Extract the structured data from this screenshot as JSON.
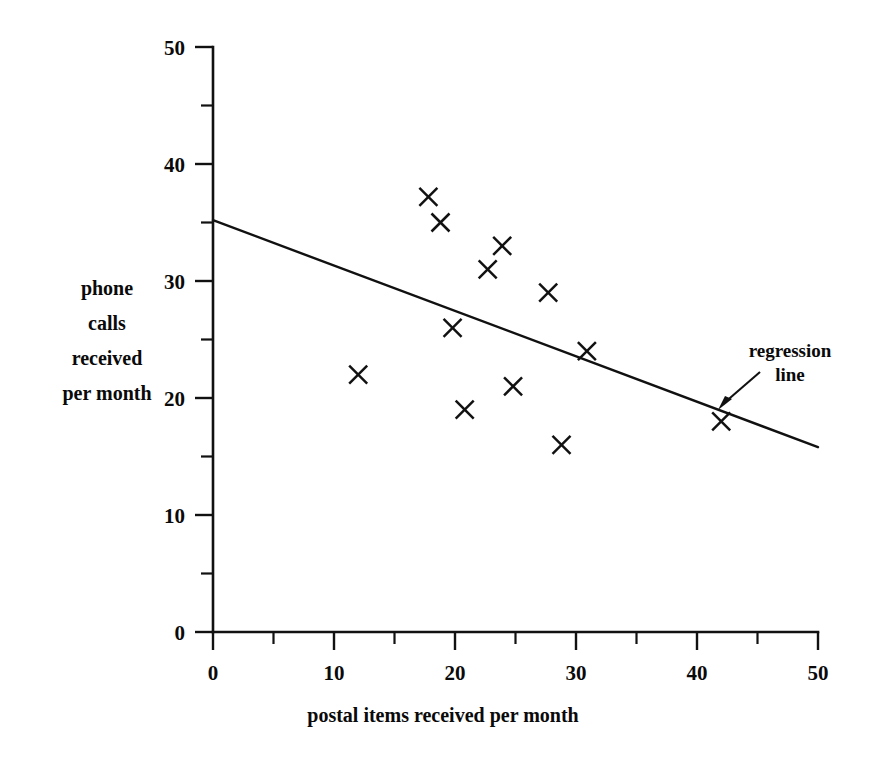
{
  "chart_data": {
    "type": "scatter",
    "title": "",
    "xlabel": "postal items received per month",
    "ylabel": "phone calls received per month",
    "ylabel_lines": [
      "phone",
      "calls",
      "received",
      "per month"
    ],
    "xlim": [
      0,
      50
    ],
    "ylim": [
      0,
      50
    ],
    "grid": false,
    "legend": "none",
    "x_major_ticks": [
      0,
      10,
      20,
      30,
      40,
      50
    ],
    "x_minor_ticks": [
      5,
      15,
      25,
      35,
      45
    ],
    "x_tick_labels": [
      "0",
      "10",
      "20",
      "30",
      "40",
      "50"
    ],
    "y_major_ticks": [
      0,
      10,
      20,
      30,
      40,
      50
    ],
    "y_minor_ticks": [
      5,
      15,
      25,
      35,
      45
    ],
    "y_tick_labels": [
      "0",
      "10",
      "20",
      "30",
      "40",
      "50"
    ],
    "marker": "x",
    "marker_color": "#111111",
    "line_color": "#111111",
    "points": [
      {
        "x": 12.0,
        "y": 22.0
      },
      {
        "x": 17.8,
        "y": 37.2
      },
      {
        "x": 18.8,
        "y": 35.0
      },
      {
        "x": 19.8,
        "y": 26.0
      },
      {
        "x": 20.8,
        "y": 19.0
      },
      {
        "x": 22.7,
        "y": 31.0
      },
      {
        "x": 23.9,
        "y": 33.0
      },
      {
        "x": 24.8,
        "y": 21.0
      },
      {
        "x": 27.7,
        "y": 29.0
      },
      {
        "x": 28.8,
        "y": 16.0
      },
      {
        "x": 30.9,
        "y": 24.0
      },
      {
        "x": 42.0,
        "y": 18.0
      }
    ],
    "regression_line": {
      "label_lines": [
        "regression",
        "line"
      ],
      "x_start": 0,
      "y_start": 35.2,
      "x_end": 50,
      "y_end": 15.8,
      "intercept": 35.2,
      "slope": -0.388
    },
    "annotations": [
      {
        "text": "regression line",
        "points_to_x": 40.0,
        "points_to_y": 19.7
      }
    ]
  }
}
